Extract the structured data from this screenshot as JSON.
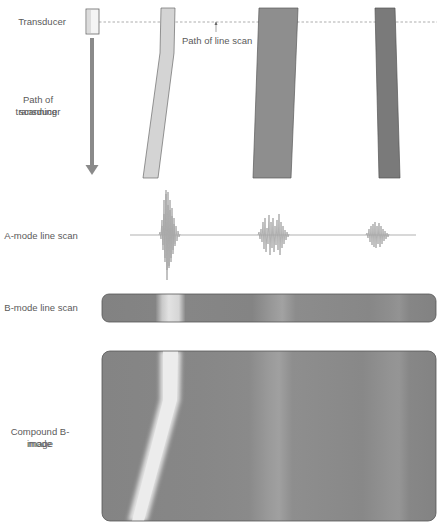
{
  "labels": {
    "transducer": "Transducer",
    "path_of_line_scan": "Path of line scan",
    "path_of_transducer_line1": "Path of transducer",
    "path_of_transducer_line2": "scanning",
    "a_mode": "A-mode line scan",
    "b_mode": "B-mode line scan",
    "compound_line1": "Compound B-mode",
    "compound_line2": "image"
  },
  "colors": {
    "reflector_1": "#d4d4d4",
    "reflector_2": "#8e8e8e",
    "reflector_3": "#7a7a7a",
    "background_tissue": "#838383",
    "waveform": "#a8a8a8",
    "arrow": "#8a8a8a",
    "outline": "#555555"
  },
  "reflectors": [
    {
      "name": "reflector-1",
      "brightness": "high",
      "echo_amplitude": "large"
    },
    {
      "name": "reflector-2",
      "brightness": "medium",
      "echo_amplitude": "medium"
    },
    {
      "name": "reflector-3",
      "brightness": "low",
      "echo_amplitude": "small"
    }
  ]
}
